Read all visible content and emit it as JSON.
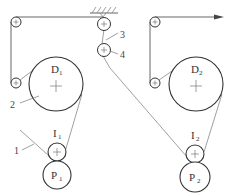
{
  "diagram": {
    "type": "belt-and-pulley schematic",
    "labels": {
      "D1": {
        "main": "D",
        "sub": "1"
      },
      "D2": {
        "main": "D",
        "sub": "2"
      },
      "I1": {
        "main": "I",
        "sub": "1"
      },
      "I2": {
        "main": "I",
        "sub": "2"
      },
      "P1": {
        "main": "P",
        "sub": "1"
      },
      "P2": {
        "main": "P",
        "sub": "2"
      }
    },
    "callouts": {
      "c1": "1",
      "c2": "2",
      "c3": "3",
      "c4": "4"
    },
    "colors": {
      "stroke": "#333333",
      "line": "#555555",
      "background": "#ffffff"
    }
  }
}
